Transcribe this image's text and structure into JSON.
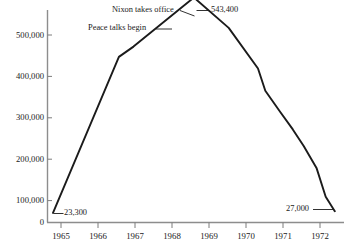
{
  "chart": {
    "title": "",
    "type": "line"
  },
  "chart_data": {
    "type": "line",
    "title": "",
    "subtitle": "",
    "xlabel": "",
    "ylabel": "",
    "xlim": [
      1964.6,
      1972.7
    ],
    "ylim": [
      0,
      560000
    ],
    "grid": false,
    "legend": "none",
    "y_ticks": [
      0,
      100000,
      200000,
      300000,
      400000,
      500000
    ],
    "y_tick_labels": [
      "0",
      "100,000",
      "200,000",
      "300,000",
      "400,000",
      "500,000"
    ],
    "x_ticks": [
      1965,
      1966,
      1967,
      1968,
      1969,
      1970,
      1971,
      1972
    ],
    "x_tick_labels": [
      "1965",
      "1966",
      "1967",
      "1968",
      "1969",
      "1970",
      "1971",
      "1972"
    ],
    "series": [
      {
        "name": "U.S. troops",
        "x": [
          1964.75,
          1966.55,
          1966.95,
          1968.6,
          1969.55,
          1970.35,
          1970.55,
          1970.95,
          1971.3,
          1971.6,
          1971.95,
          1972.2,
          1972.45
        ],
        "values": [
          23300,
          400000,
          425000,
          543400,
          470000,
          372000,
          318000,
          268000,
          225000,
          185000,
          132000,
          62000,
          27000
        ]
      }
    ],
    "annotations": [
      {
        "name": "nixon-takes-office",
        "text": "Nixon takes office",
        "points_to_x": 1968.6,
        "points_to_y": 543400
      },
      {
        "name": "peace-talks-begin",
        "text": "Peace talks begin",
        "points_to_x": 1968.1,
        "points_to_y": 512000
      },
      {
        "name": "start-value",
        "text": "23,300",
        "points_to_x": 1964.75,
        "points_to_y": 23300
      },
      {
        "name": "peak-value",
        "text": "543,400",
        "points_to_x": 1968.6,
        "points_to_y": 543400
      },
      {
        "name": "end-value",
        "text": "27,000",
        "points_to_x": 1972.45,
        "points_to_y": 27000
      }
    ]
  },
  "labels": {
    "y": [
      "500,000",
      "400,000",
      "300,000",
      "200,000",
      "100,000",
      "0"
    ],
    "x": [
      "1965",
      "1966",
      "1967",
      "1968",
      "1969",
      "1970",
      "1971",
      "1972"
    ],
    "nixon": "Nixon takes office",
    "peace": "Peace talks begin",
    "start_value": "23,300",
    "peak_value": "543,400",
    "end_value": "27,000"
  },
  "colors": {
    "line": "#1b1b1b",
    "axis": "#8d8d8d",
    "text": "#1a1a1a",
    "background": "#ffffff"
  }
}
